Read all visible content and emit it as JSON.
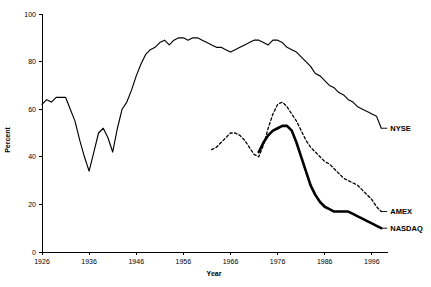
{
  "chart_data": {
    "type": "line",
    "title": "",
    "subtitle": "",
    "xlabel": "Year",
    "ylabel": "Percent",
    "xlim": [
      1926,
      1999
    ],
    "ylim": [
      0,
      100
    ],
    "xticks": [
      1926,
      1936,
      1946,
      1956,
      1966,
      1976,
      1986,
      1996
    ],
    "xtick_labels": [
      "1926",
      "1936",
      "1946",
      "1956",
      "1966",
      "1976",
      "1986",
      "1996"
    ],
    "yticks": [
      0,
      20,
      40,
      60,
      80,
      100
    ],
    "ytick_labels": [
      "0",
      "20",
      "40",
      "60",
      "80",
      "100"
    ],
    "grid": false,
    "legend_position": "right-inline-labels",
    "series": [
      {
        "name": "NYSE",
        "label": "NYSE",
        "style": "solid",
        "color": "#000000",
        "x": [
          1926,
          1927,
          1928,
          1929,
          1930,
          1931,
          1932,
          1933,
          1934,
          1935,
          1936,
          1937,
          1938,
          1939,
          1940,
          1941,
          1942,
          1943,
          1944,
          1945,
          1946,
          1947,
          1948,
          1949,
          1950,
          1951,
          1952,
          1953,
          1954,
          1955,
          1956,
          1957,
          1958,
          1959,
          1960,
          1961,
          1962,
          1963,
          1964,
          1965,
          1966,
          1967,
          1968,
          1969,
          1970,
          1971,
          1972,
          1973,
          1974,
          1975,
          1976,
          1977,
          1978,
          1979,
          1980,
          1981,
          1982,
          1983,
          1984,
          1985,
          1986,
          1987,
          1988,
          1989,
          1990,
          1991,
          1992,
          1993,
          1994,
          1995,
          1996,
          1997,
          1998
        ],
        "y": [
          62,
          64,
          63,
          65,
          65,
          65,
          60,
          55,
          47,
          40,
          34,
          42,
          50,
          52,
          48,
          42,
          52,
          60,
          63,
          68,
          74,
          79,
          83,
          85,
          86,
          88,
          89,
          87,
          89,
          90,
          90,
          89,
          90,
          90,
          89,
          88,
          87,
          86,
          86,
          85,
          84,
          85,
          86,
          87,
          88,
          89,
          89,
          88,
          87,
          89,
          89,
          88,
          86,
          85,
          84,
          82,
          80,
          78,
          75,
          74,
          72,
          70,
          69,
          67,
          66,
          64,
          63,
          61,
          60,
          59,
          58,
          57,
          52
        ]
      },
      {
        "name": "AMEX",
        "label": "AMEX",
        "style": "dashed",
        "color": "#000000",
        "x": [
          1962,
          1963,
          1964,
          1965,
          1966,
          1967,
          1968,
          1969,
          1970,
          1971,
          1972,
          1973,
          1974,
          1975,
          1976,
          1977,
          1978,
          1979,
          1980,
          1981,
          1982,
          1983,
          1984,
          1985,
          1986,
          1987,
          1988,
          1989,
          1990,
          1991,
          1992,
          1993,
          1994,
          1995,
          1996,
          1997,
          1998
        ],
        "y": [
          43,
          44,
          46,
          48,
          50,
          50,
          49,
          47,
          44,
          41,
          40,
          45,
          52,
          58,
          62,
          63,
          61,
          58,
          55,
          51,
          47,
          44,
          42,
          40,
          38,
          37,
          35,
          33,
          31,
          30,
          29,
          28,
          26,
          24,
          22,
          19,
          17
        ]
      },
      {
        "name": "NASDAQ",
        "label": "NASDAQ",
        "style": "solid-thick",
        "color": "#000000",
        "x": [
          1972,
          1973,
          1974,
          1975,
          1976,
          1977,
          1978,
          1979,
          1980,
          1981,
          1982,
          1983,
          1984,
          1985,
          1986,
          1987,
          1988,
          1989,
          1990,
          1991,
          1992,
          1993,
          1994,
          1995,
          1996,
          1997,
          1998
        ],
        "y": [
          42,
          46,
          49,
          51,
          52,
          53,
          53,
          51,
          46,
          40,
          34,
          28,
          24,
          21,
          19,
          18,
          17,
          17,
          17,
          17,
          16,
          15,
          14,
          13,
          12,
          11,
          10
        ]
      }
    ]
  }
}
